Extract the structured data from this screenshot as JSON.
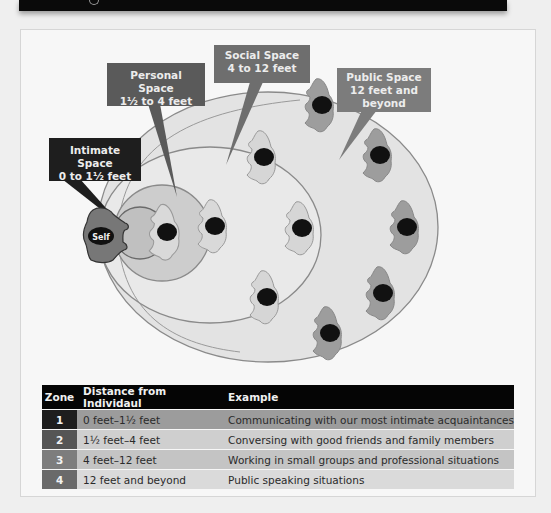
{
  "diagram": {
    "self_label": "Self",
    "callouts": {
      "intimate": {
        "line1": "Intimate Space",
        "line2": "0 to 1½ feet",
        "color": "#1e1e1e"
      },
      "personal": {
        "line1": "Personal Space",
        "line2": "1½ to 4 feet",
        "color": "#5a5a5a"
      },
      "social": {
        "line1": "Social Space",
        "line2": "4 to 12 feet",
        "color": "#6e6e6e"
      },
      "public": {
        "line1": "Public Space",
        "line2": "12 feet and",
        "line3": "beyond",
        "color": "#7c7c7c"
      }
    },
    "zones_colors": {
      "public_fill": "#e3e3e3",
      "social_fill": "#e8e8e8",
      "personal_fill": "#cdcdcd",
      "intimate_fill": "#c2c2c2",
      "outline": "#8a8a8a"
    }
  },
  "table": {
    "headers": {
      "zone": "Zone",
      "distance": "Distance from Individaul",
      "example": "Example"
    },
    "rows": [
      {
        "zone": "1",
        "distance": "0 feet–1½ feet",
        "example": "Communicating with our most intimate acquaintances"
      },
      {
        "zone": "2",
        "distance": "1½ feet–4 feet",
        "example": "Conversing with good friends and family members"
      },
      {
        "zone": "3",
        "distance": "4 feet–12 feet",
        "example": "Working in small groups and professional situations"
      },
      {
        "zone": "4",
        "distance": "12 feet and beyond",
        "example": "Public speaking situations"
      }
    ]
  }
}
